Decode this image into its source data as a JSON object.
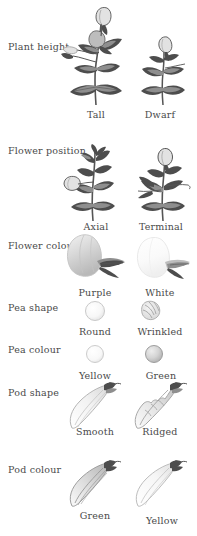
{
  "figure": {
    "traits": [
      {
        "id": "plant-height",
        "label": "Plant height",
        "forms": [
          {
            "id": "tall",
            "label": "Tall",
            "illustration": "tall-pea-plant-illustration"
          },
          {
            "id": "dwarf",
            "label": "Dwarf",
            "illustration": "dwarf-pea-plant-illustration"
          }
        ]
      },
      {
        "id": "flower-position",
        "label": "Flower position",
        "forms": [
          {
            "id": "axial",
            "label": "Axial",
            "illustration": "axial-flower-plant-illustration"
          },
          {
            "id": "terminal",
            "label": "Terminal",
            "illustration": "terminal-flower-plant-illustration"
          }
        ]
      },
      {
        "id": "flower-colour",
        "label": "Flower colour",
        "forms": [
          {
            "id": "purple",
            "label": "Purple",
            "illustration": "purple-flower-illustration"
          },
          {
            "id": "white",
            "label": "White",
            "illustration": "white-flower-illustration"
          }
        ]
      },
      {
        "id": "pea-shape",
        "label": "Pea shape",
        "forms": [
          {
            "id": "round",
            "label": "Round",
            "illustration": "round-pea-illustration"
          },
          {
            "id": "wrinkled",
            "label": "Wrinkled",
            "illustration": "wrinkled-pea-illustration"
          }
        ]
      },
      {
        "id": "pea-colour",
        "label": "Pea colour",
        "forms": [
          {
            "id": "yellow",
            "label": "Yellow",
            "illustration": "yellow-pea-illustration"
          },
          {
            "id": "green",
            "label": "Green",
            "illustration": "green-pea-illustration"
          }
        ]
      },
      {
        "id": "pod-shape",
        "label": "Pod shape",
        "forms": [
          {
            "id": "smooth",
            "label": "Smooth",
            "illustration": "smooth-pod-illustration"
          },
          {
            "id": "ridged",
            "label": "Ridged",
            "illustration": "ridged-pod-illustration"
          }
        ]
      },
      {
        "id": "pod-colour",
        "label": "Pod colour",
        "forms": [
          {
            "id": "green",
            "label": "Green",
            "illustration": "green-pod-illustration"
          },
          {
            "id": "yellow",
            "label": "Yellow",
            "illustration": "yellow-pod-illustration"
          }
        ]
      }
    ],
    "colors": {
      "background": "#ffffff",
      "text": "#4a4a4a",
      "ink_dark": "#4d4d4d",
      "ink_mid": "#8e8e8e",
      "ink_soft": "#bdbdbd",
      "ink_pale": "#e2e2e2"
    }
  }
}
